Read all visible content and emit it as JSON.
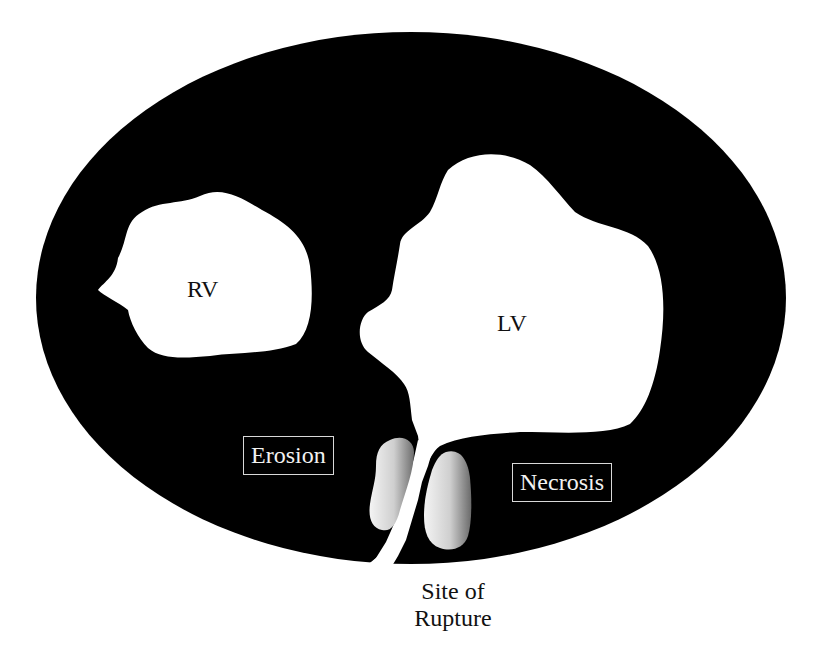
{
  "diagram": {
    "type": "anatomical cross-section (ventricular septal rupture)",
    "colors": {
      "myocardium": "#000000",
      "cavity": "#ffffff",
      "lesion_light": "#f2f2f2",
      "lesion_dark": "#8a8a8a",
      "box_border": "#d8d8d8",
      "text_dark": "#111111",
      "text_light": "#f2f2f2"
    },
    "labels": {
      "rv": "RV",
      "lv": "LV",
      "erosion": "Erosion",
      "necrosis": "Necrosis",
      "rupture_line1": "Site of",
      "rupture_line2": "Rupture"
    }
  }
}
